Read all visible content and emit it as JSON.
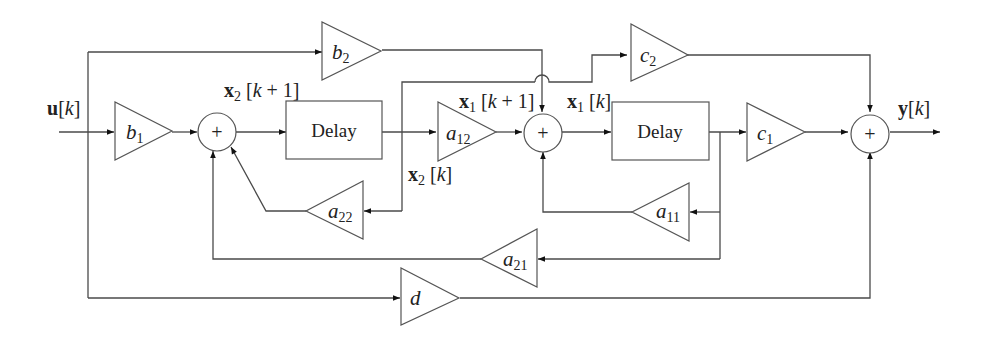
{
  "diagram": {
    "type": "state-space block diagram (discrete-time, 2nd order)",
    "signals": {
      "input": {
        "name": "u",
        "index": "k",
        "label": "u[k]"
      },
      "output": {
        "name": "y",
        "index": "k",
        "label": "y[k]"
      },
      "x2_next": {
        "name": "x",
        "sub": "2",
        "index": "k + 1",
        "label": "x2[k + 1]"
      },
      "x2": {
        "name": "x",
        "sub": "2",
        "index": "k",
        "label": "x2[k]"
      },
      "x1_next": {
        "name": "x",
        "sub": "1",
        "index": "k + 1",
        "label": "x1[k + 1]"
      },
      "x1": {
        "name": "x",
        "sub": "1",
        "index": "k",
        "label": "x1[k]"
      }
    },
    "gains": {
      "b1": {
        "base": "b",
        "sub": "1"
      },
      "b2": {
        "base": "b",
        "sub": "2"
      },
      "a12": {
        "base": "a",
        "sub": "12"
      },
      "a22": {
        "base": "a",
        "sub": "22"
      },
      "a11": {
        "base": "a",
        "sub": "11"
      },
      "a21": {
        "base": "a",
        "sub": "21"
      },
      "c1": {
        "base": "c",
        "sub": "1"
      },
      "c2": {
        "base": "c",
        "sub": "2"
      },
      "d": {
        "base": "d",
        "sub": ""
      }
    },
    "delays": [
      {
        "id": "delay-2",
        "label": "Delay"
      },
      {
        "id": "delay-1",
        "label": "Delay"
      }
    ],
    "summers": {
      "symbol": "+"
    },
    "colors": {
      "line": "#4a4a4a",
      "text": "#222222",
      "background": "#ffffff"
    }
  }
}
